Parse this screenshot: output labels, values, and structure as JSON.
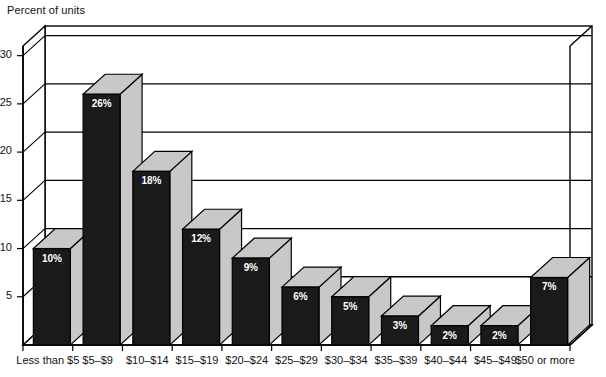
{
  "chart_data": {
    "type": "bar",
    "title": "",
    "ylabel": "Percent of units",
    "xlabel": "",
    "ylim": [
      0,
      31
    ],
    "yticks": [
      5,
      10,
      15,
      20,
      25,
      30
    ],
    "grid": true,
    "legend": "none",
    "style": "3d-bar",
    "categories": [
      "Less than $5",
      "$5–$9",
      "$10–$14",
      "$15–$19",
      "$20–$24",
      "$25–$29",
      "$30–$34",
      "$35–$39",
      "$40–$44",
      "$45–$49",
      "$50 or more"
    ],
    "values": [
      10,
      26,
      18,
      12,
      9,
      6,
      5,
      3,
      2,
      2,
      7
    ],
    "data_labels": [
      "10%",
      "26%",
      "18%",
      "12%",
      "9%",
      "6%",
      "5%",
      "3%",
      "2%",
      "2%",
      "7%"
    ],
    "colors": {
      "bar_front": "#1a1a1a",
      "bar_top": "#c8c8c8",
      "bar_side": "#c8c8c8",
      "axis": "#000000",
      "grid": "#000000",
      "label_text": "#ffffff",
      "background": "#ffffff"
    }
  },
  "ylabels": {
    "t5": "5",
    "t10": "10",
    "t15": "15",
    "t20": "20",
    "t25": "25",
    "t30": "30"
  }
}
